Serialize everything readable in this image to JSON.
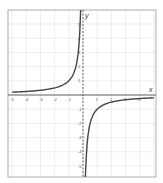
{
  "chart_data": {
    "type": "line",
    "title": "",
    "xlabel": "x",
    "ylabel": "y",
    "xlim": [
      -5,
      5
    ],
    "ylim": [
      -6,
      6
    ],
    "grid": true,
    "x_ticks": [
      -5,
      -4,
      -3,
      -2,
      -1,
      1,
      2,
      3,
      4
    ],
    "y_ticks": [
      -5,
      -4,
      -3,
      -2,
      -1,
      1,
      2,
      3,
      4,
      5
    ],
    "vertical_asymptote": {
      "x": 0,
      "style": "dashed"
    },
    "horizontal_asymptote": {
      "y": 0
    },
    "series": [
      {
        "name": "y = -1/x",
        "x": [
          -5,
          -4,
          -3,
          -2,
          -1,
          -0.5,
          -0.25,
          -0.17
        ],
        "values": [
          0.2,
          0.25,
          0.33,
          0.5,
          1,
          2,
          4,
          6
        ]
      },
      {
        "name": "y = -1/x",
        "x": [
          0.17,
          0.25,
          0.5,
          1,
          2,
          3,
          4,
          5
        ],
        "values": [
          -6,
          -4,
          -2,
          -1,
          -0.5,
          -0.33,
          -0.25,
          -0.2
        ]
      }
    ]
  },
  "labels": {
    "x_axis": "x",
    "y_axis": "y"
  }
}
